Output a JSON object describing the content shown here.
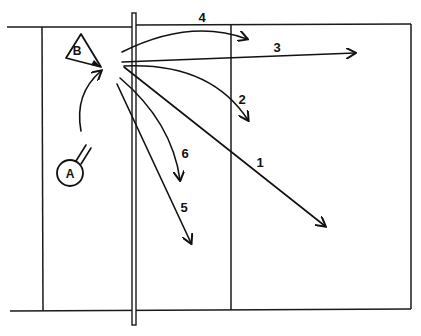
{
  "diagram": {
    "colors": {
      "ink": "#111111",
      "background": "#ffffff"
    },
    "players": [
      {
        "id": "A",
        "label": "A",
        "shape": "circle"
      },
      {
        "id": "B",
        "label": "B",
        "shape": "triangle"
      }
    ],
    "paths": [
      {
        "id": "1",
        "label": "1"
      },
      {
        "id": "2",
        "label": "2"
      },
      {
        "id": "3",
        "label": "3"
      },
      {
        "id": "4",
        "label": "4"
      },
      {
        "id": "5",
        "label": "5"
      },
      {
        "id": "6",
        "label": "6"
      }
    ]
  }
}
